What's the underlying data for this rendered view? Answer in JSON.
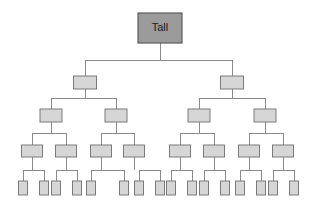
{
  "diagram": {
    "title": "Tall",
    "type": "binary-tree",
    "depth": 5,
    "colors": {
      "background": "#ffffff",
      "root_fill": "#9b9b9b",
      "root_stroke": "#5c5c5c",
      "node_fill": "#d6d6d6",
      "node_stroke": "#7a7a7a",
      "connector": "#8a8a8a",
      "label_text": "#1a1a1a"
    },
    "root": {
      "label": "Tall",
      "x": 138,
      "y": 13,
      "width": 44,
      "height": 30
    },
    "levels": [
      {
        "level": 2,
        "count": 2,
        "y": 76,
        "width": 23,
        "height": 13,
        "centers": [
          85,
          232
        ]
      },
      {
        "level": 3,
        "count": 4,
        "y": 109,
        "width": 22,
        "height": 13,
        "centers": [
          51,
          116,
          199,
          265
        ]
      },
      {
        "level": 4,
        "count": 8,
        "y": 145,
        "width": 21,
        "height": 12,
        "centers": [
          32,
          66,
          101,
          134,
          180,
          214,
          249,
          283
        ]
      },
      {
        "level": 5,
        "count": 16,
        "y": 181,
        "width": 9,
        "height": 14,
        "centers": [
          23,
          44,
          56,
          77,
          91,
          124,
          139,
          160,
          171,
          192,
          204,
          225,
          240,
          261,
          273,
          294
        ]
      }
    ],
    "edges": {
      "root_to_level2_bus_y": 60,
      "level2_to_level3_bus_y": 98,
      "level3_to_level4_bus_y": 133,
      "level4_to_level5_bus_y": 170
    }
  }
}
